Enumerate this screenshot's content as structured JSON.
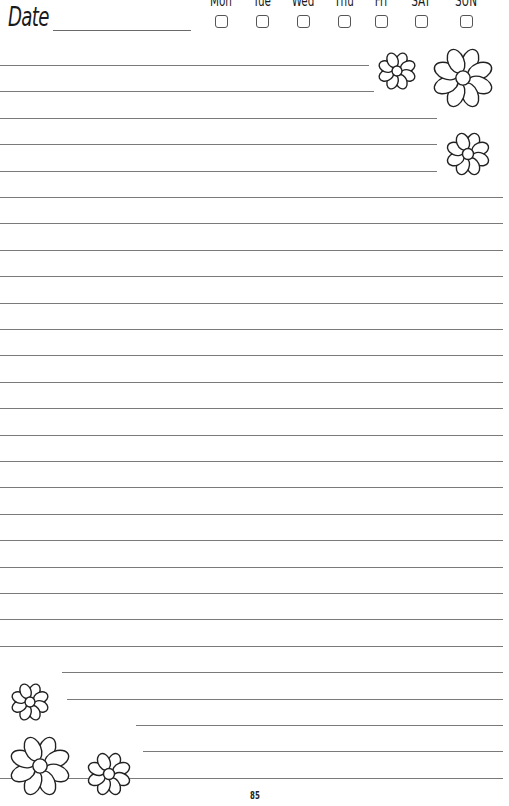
{
  "header": {
    "date_label": "Date",
    "days": [
      {
        "label": "Mon",
        "x": 201
      },
      {
        "label": "Tue",
        "x": 242
      },
      {
        "label": "Wed",
        "x": 283
      },
      {
        "label": "Thu",
        "x": 324
      },
      {
        "label": "Fri",
        "x": 361
      },
      {
        "label": "SAT",
        "x": 401
      },
      {
        "label": "SUN",
        "x": 446
      }
    ]
  },
  "lines": {
    "count": 28,
    "first_y": 65,
    "spacing": 26.4,
    "color": "#7a7a7a"
  },
  "footer": {
    "page_number": "85"
  },
  "colors": {
    "ink": "#1a1a1a",
    "rule": "#7a7a7a",
    "paper": "#ffffff"
  }
}
